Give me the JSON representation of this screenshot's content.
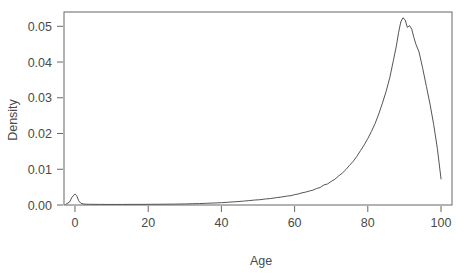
{
  "chart_data": {
    "type": "line",
    "title": "",
    "subtitle": "",
    "xlabel": "Age",
    "ylabel": "Density",
    "xlim": [
      -3,
      103
    ],
    "ylim": [
      0.0,
      0.054
    ],
    "grid": false,
    "legend": null,
    "xticks": [
      0,
      20,
      40,
      60,
      80,
      100
    ],
    "xtick_labels": [
      "0",
      "20",
      "40",
      "60",
      "80",
      "100"
    ],
    "yticks": [
      0.0,
      0.01,
      0.02,
      0.03,
      0.04,
      0.05
    ],
    "ytick_labels": [
      "0.00",
      "0.01",
      "0.02",
      "0.03",
      "0.04",
      "0.05"
    ],
    "line_color": "#555555",
    "frame_color": "#666666",
    "background_color": "#ffffff",
    "series": [
      {
        "name": "Age density",
        "x": [
          -2.5,
          -1.5,
          -0.8,
          0.0,
          0.5,
          1.0,
          1.6,
          2.2,
          3.0,
          4.0,
          5.5,
          7.0,
          9.0,
          11.0,
          13.0,
          15.0,
          18.0,
          21.0,
          24.0,
          27.0,
          30.0,
          32.0,
          34.0,
          36.0,
          38.0,
          40.0,
          42.0,
          44.0,
          46.0,
          47.5,
          49.0,
          50.5,
          52.0,
          53.5,
          55.0,
          56.5,
          58.0,
          59.0,
          60.0,
          61.0,
          62.0,
          63.0,
          64.0,
          65.0,
          66.0,
          67.0,
          68.0,
          69.0,
          70.0,
          71.0,
          72.0,
          73.0,
          74.0,
          75.0,
          76.0,
          77.0,
          78.0,
          79.0,
          80.0,
          81.0,
          82.0,
          83.0,
          84.0,
          85.0,
          86.0,
          87.0,
          87.8,
          88.4,
          89.0,
          89.6,
          90.2,
          90.8,
          91.4,
          92.0,
          92.6,
          93.2,
          94.0,
          95.0,
          96.0,
          97.0,
          98.0,
          99.0,
          100.0
        ],
        "y": [
          0.0002,
          0.0008,
          0.0022,
          0.0031,
          0.0026,
          0.0012,
          0.0005,
          0.0003,
          0.00022,
          0.0002,
          0.00018,
          0.00017,
          0.00016,
          0.00016,
          0.00016,
          0.00017,
          0.00018,
          0.0002,
          0.00022,
          0.00025,
          0.0003,
          0.00035,
          0.0004,
          0.00048,
          0.00056,
          0.00065,
          0.00078,
          0.00092,
          0.00108,
          0.00122,
          0.00138,
          0.00148,
          0.00168,
          0.00182,
          0.00205,
          0.00225,
          0.0025,
          0.00262,
          0.0029,
          0.00308,
          0.0034,
          0.0036,
          0.0039,
          0.00415,
          0.0046,
          0.0049,
          0.0056,
          0.0059,
          0.0066,
          0.0072,
          0.0081,
          0.0089,
          0.0099,
          0.0111,
          0.0122,
          0.0136,
          0.0152,
          0.0168,
          0.0186,
          0.0206,
          0.0228,
          0.0255,
          0.0285,
          0.0318,
          0.0356,
          0.0405,
          0.0445,
          0.0482,
          0.0512,
          0.0524,
          0.0518,
          0.0497,
          0.0502,
          0.0492,
          0.0468,
          0.0448,
          0.0428,
          0.0382,
          0.0332,
          0.0282,
          0.0225,
          0.0158,
          0.0073
        ]
      }
    ]
  },
  "axes": {
    "x_label": "Age",
    "y_label": "Density"
  }
}
